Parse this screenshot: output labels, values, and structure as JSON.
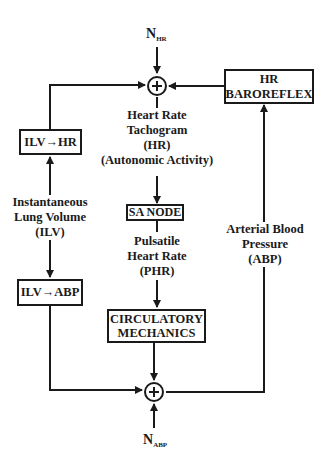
{
  "diagram": {
    "noise_hr": {
      "main": "N",
      "sub": "HR"
    },
    "noise_abp": {
      "main": "N",
      "sub": "ABP"
    },
    "sum_top": {
      "symbol": "+"
    },
    "sum_bottom": {
      "symbol": "+"
    },
    "boxes": {
      "hr_baroreflex": [
        "HR",
        "BAROREFLEX"
      ],
      "ilv_hr": "ILV→HR",
      "ilv_abp": "ILV→ABP",
      "sa_node": "SA NODE",
      "circulatory_mechanics": [
        "CIRCULATORY",
        "MECHANICS"
      ]
    },
    "labels": {
      "hr_tachogram": [
        "Heart Rate",
        "Tachogram",
        "(HR)",
        "(Autonomic Activity)"
      ],
      "ilv": [
        "Instantaneous",
        "Lung Volume",
        "(ILV)"
      ],
      "phr": [
        "Pulsatile",
        "Heart Rate",
        "(PHR)"
      ],
      "abp": [
        "Arterial Blood",
        "Pressure",
        "(ABP)"
      ]
    },
    "colors": {
      "stroke": "#1a1a1a",
      "background": "#ffffff"
    }
  }
}
